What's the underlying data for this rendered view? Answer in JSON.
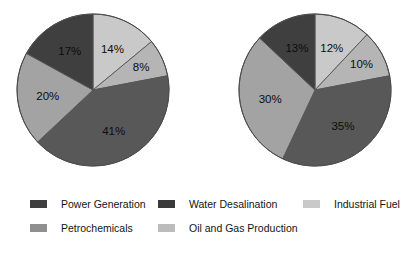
{
  "chart_data": [
    {
      "type": "pie",
      "name": "pie-chart-left",
      "title": "",
      "labels": [
        "Industrial Fuel",
        "Oil and Gas Production",
        "Water Desalination",
        "Petrochemicals",
        "Power Generation"
      ],
      "values": [
        14,
        8,
        41,
        20,
        17
      ],
      "value_labels": [
        "14%",
        "8%",
        "41%",
        "20%",
        "17%"
      ],
      "colors": [
        "#c9c9c9",
        "#b5b5b5",
        "#585858",
        "#a3a3a3",
        "#3f3f3f"
      ],
      "start_angle_deg": 0,
      "direction": "clockwise",
      "legend_position": "bottom",
      "grid": false
    },
    {
      "type": "pie",
      "name": "pie-chart-right",
      "title": "",
      "labels": [
        "Industrial Fuel",
        "Oil and Gas Production",
        "Water Desalination",
        "Petrochemicals",
        "Power Generation"
      ],
      "values": [
        12,
        10,
        35,
        30,
        13
      ],
      "value_labels": [
        "12%",
        "10%",
        "35%",
        "30%",
        "13%"
      ],
      "colors": [
        "#c9c9c9",
        "#b5b5b5",
        "#585858",
        "#a3a3a3",
        "#3f3f3f"
      ],
      "start_angle_deg": 0,
      "direction": "clockwise",
      "legend_position": "bottom",
      "grid": false
    }
  ],
  "legend": {
    "rows": [
      [
        {
          "label": "Power Generation",
          "color": "#3f3f3f"
        },
        {
          "label": "Water Desalination",
          "color": "#3a3a3a"
        },
        {
          "label": "Industrial Fuel",
          "color": "#c9c9c9"
        }
      ],
      [
        {
          "label": "Petrochemicals",
          "color": "#8f8f8f"
        },
        {
          "label": "Oil and Gas Production",
          "color": "#bcbcbc"
        }
      ]
    ]
  },
  "figure": {
    "background": "#ffffff",
    "pie_outline_color": "#555555"
  }
}
